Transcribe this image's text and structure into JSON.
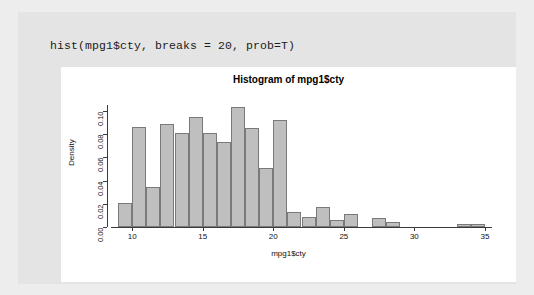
{
  "console": {
    "command": "hist(mpg1$cty, breaks = 20, prob=T)"
  },
  "colors": {
    "page_background": "#ededed",
    "panel_background": "#e4e4e4",
    "plot_background": "#ffffff",
    "bar_fill": "#bfbfbf",
    "bar_border": "#7a7a7a",
    "axis": "#3a3a3a",
    "text": "#111111"
  },
  "chart_data": {
    "type": "bar",
    "title": "Histogram of mpg1$cty",
    "xlabel": "mpg1$cty",
    "ylabel": "Density",
    "grid": false,
    "legend": null,
    "xlim": [
      8.5,
      35.5
    ],
    "ylim": [
      0.0,
      0.105
    ],
    "xticks": [
      10,
      15,
      20,
      25,
      30,
      35
    ],
    "ytick_labels": [
      "0.00",
      "0.02",
      "0.04",
      "0.06",
      "0.08",
      "0.10"
    ],
    "yticks": [
      0.0,
      0.02,
      0.04,
      0.06,
      0.08,
      0.1
    ],
    "bin_width": 1,
    "bin_starts": [
      9,
      10,
      11,
      12,
      13,
      14,
      15,
      16,
      17,
      18,
      19,
      20,
      21,
      22,
      23,
      24,
      25,
      26,
      27,
      28,
      29,
      30,
      31,
      32,
      33,
      34
    ],
    "categories": [
      "9-10",
      "10-11",
      "11-12",
      "12-13",
      "13-14",
      "14-15",
      "15-16",
      "16-17",
      "17-18",
      "18-19",
      "19-20",
      "20-21",
      "21-22",
      "22-23",
      "23-24",
      "24-25",
      "25-26",
      "26-27",
      "27-28",
      "28-29",
      "29-30",
      "30-31",
      "31-32",
      "32-33",
      "33-34",
      "34-35"
    ],
    "values": [
      0.021,
      0.086,
      0.034,
      0.089,
      0.081,
      0.095,
      0.081,
      0.073,
      0.103,
      0.085,
      0.051,
      0.092,
      0.013,
      0.009,
      0.017,
      0.006,
      0.011,
      0.0,
      0.008,
      0.004,
      0.0,
      0.0,
      0.0,
      0.0,
      0.003,
      0.003
    ]
  }
}
